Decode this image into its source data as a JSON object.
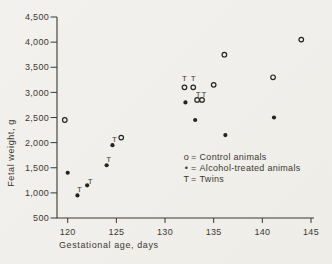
{
  "colors": {
    "paper": "#f1efeb",
    "ink": "#3b382f",
    "marker": "#26241f"
  },
  "chart_data": {
    "type": "scatter",
    "title": "",
    "xlabel": "Gestational age, days",
    "ylabel": "Fetal weight, g",
    "xlim": [
      120,
      145
    ],
    "ylim": [
      500,
      4500
    ],
    "grid": false,
    "legend_position": "inside-right-middle",
    "xticks": [
      120,
      125,
      130,
      135,
      140,
      145
    ],
    "xtick_labels": [
      "120",
      "125",
      "130",
      "135",
      "140",
      "145"
    ],
    "yticks": [
      500,
      1000,
      1500,
      2000,
      2500,
      3000,
      3500,
      4000,
      4500
    ],
    "ytick_labels": [
      "500",
      "1,000",
      "1,500",
      "2,000",
      "2,500",
      "3,000",
      "3,500",
      "4,000",
      "4,500"
    ],
    "series": [
      {
        "name": "Control animals",
        "marker": "open-circle",
        "points": [
          [
            119.7,
            2450
          ],
          [
            125.5,
            2100
          ],
          [
            132.0,
            3100
          ],
          [
            132.9,
            3100
          ],
          [
            133.3,
            2850
          ],
          [
            133.8,
            2850
          ],
          [
            135.0,
            3150
          ],
          [
            136.1,
            3750
          ],
          [
            141.1,
            3300
          ],
          [
            144.0,
            4050
          ]
        ]
      },
      {
        "name": "Alcohol-treated animals",
        "marker": "filled-circle",
        "points": [
          [
            120.0,
            1400
          ],
          [
            121.0,
            950
          ],
          [
            122.0,
            1150
          ],
          [
            124.0,
            1550
          ],
          [
            124.6,
            1950
          ],
          [
            132.1,
            2800
          ],
          [
            133.1,
            2450
          ],
          [
            136.2,
            2150
          ],
          [
            141.2,
            2500
          ]
        ]
      }
    ],
    "twin_markers": {
      "glyph": "T",
      "positions": [
        [
          121.2,
          1070
        ],
        [
          122.3,
          1230
        ],
        [
          124.2,
          1670
        ],
        [
          124.8,
          2060
        ],
        [
          132.0,
          3280
        ],
        [
          132.9,
          3280
        ],
        [
          133.4,
          2960
        ],
        [
          134.0,
          2960
        ]
      ]
    },
    "legend": {
      "eq": "=",
      "items": [
        {
          "symbol": "o",
          "label": "Control animals"
        },
        {
          "symbol": "•",
          "label": "Alcohol-treated animals"
        },
        {
          "symbol": "T",
          "label": "Twins"
        }
      ]
    }
  }
}
